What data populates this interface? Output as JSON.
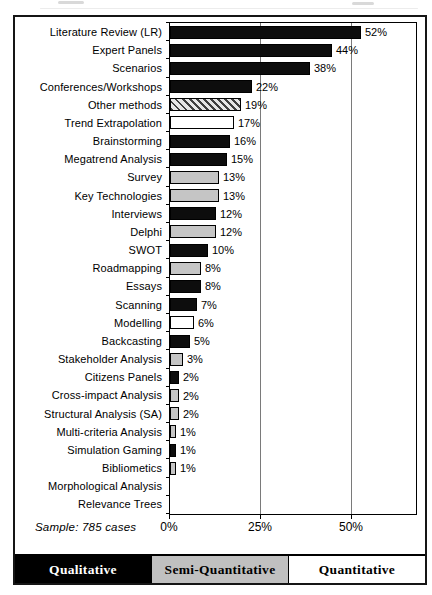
{
  "colors": {
    "bar_black": "#0d0d0d",
    "bar_gray": "#c5c5c5",
    "bar_white": "#ffffff",
    "hatch_dark": "#3f3f3f",
    "hatch_light": "#e6e6e6",
    "grid": "#7a7a7a",
    "frame": "#000000",
    "legend_black_bg": "#000000",
    "legend_gray_bg": "#c0c0c0",
    "legend_white_bg": "#ffffff"
  },
  "chart_data": {
    "type": "bar",
    "orientation": "horizontal",
    "unit": "%",
    "title": "",
    "xlabel": "",
    "ylabel": "",
    "x_ticks": [
      "0%",
      "25%",
      "50%"
    ],
    "x_tick_values": [
      0,
      25,
      50
    ],
    "xlim": [
      0,
      68
    ],
    "gridlines_at": [
      25,
      50
    ],
    "grid": "vertical-only",
    "legend_position": "bottom-band",
    "sample_note": "Sample: 785 cases",
    "categories": [
      "Literature Review (LR)",
      "Expert Panels",
      "Scenarios",
      "Conferences/Workshops",
      "Other methods",
      "Trend Extrapolation",
      "Brainstorming",
      "Megatrend Analysis",
      "Survey",
      "Key Technologies",
      "Interviews",
      "Delphi",
      "SWOT",
      "Roadmapping",
      "Essays",
      "Scanning",
      "Modelling",
      "Backcasting",
      "Stakeholder Analysis",
      "Citizens Panels",
      "Cross-impact Analysis",
      "Structural Analysis (SA)",
      "Multi-criteria Analysis",
      "Simulation Gaming",
      "Bibliometics",
      "Morphological Analysis",
      "Relevance Trees"
    ],
    "values": [
      52,
      44,
      38,
      22,
      19,
      17,
      16,
      15,
      13,
      13,
      12,
      12,
      10,
      8,
      8,
      7,
      6,
      5,
      3,
      2,
      2,
      2,
      1,
      1,
      1,
      0,
      0
    ],
    "value_labels": [
      "52%",
      "44%",
      "38%",
      "22%",
      "19%",
      "17%",
      "16%",
      "15%",
      "13%",
      "13%",
      "12%",
      "12%",
      "10%",
      "8%",
      "8%",
      "7%",
      "6%",
      "5%",
      "3%",
      "2%",
      "2%",
      "2%",
      "1%",
      "1%",
      "1%",
      "",
      ""
    ],
    "styles": [
      "black",
      "black",
      "black",
      "black",
      "hatched",
      "white",
      "black",
      "black",
      "gray",
      "gray",
      "black",
      "gray",
      "black",
      "gray",
      "black",
      "black",
      "white",
      "black",
      "gray",
      "black",
      "gray",
      "gray",
      "gray",
      "black",
      "gray",
      "none",
      "none"
    ],
    "legend": [
      {
        "label": "Qualitative",
        "style": "black",
        "bg": "#000000",
        "fg": "#ffffff"
      },
      {
        "label": "Semi-Quantitative",
        "style": "gray",
        "bg": "#c0c0c0",
        "fg": "#000000"
      },
      {
        "label": "Quantitative",
        "style": "white",
        "bg": "#ffffff",
        "fg": "#000000"
      }
    ]
  }
}
